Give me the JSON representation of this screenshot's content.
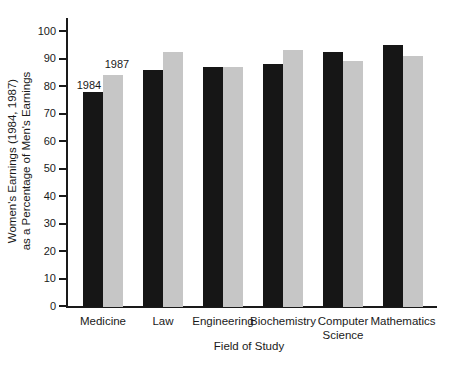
{
  "figure": {
    "y_axis_title_line1": "Women's Earnings (1984, 1987)",
    "y_axis_title_line2": "as a Percentage of Men's Earnings",
    "x_axis_title": "Field of Study"
  },
  "chart_data": {
    "type": "bar",
    "title": "",
    "xlabel": "Field of Study",
    "ylabel": "Women's Earnings (1984, 1987) as a Percentage of Men's Earnings",
    "categories": [
      "Medicine",
      "Law",
      "Engineering",
      "Biochemistry",
      "Computer Science",
      "Mathematics"
    ],
    "series": [
      {
        "name": "1984",
        "color": "#161616",
        "values": [
          78,
          86,
          87,
          88,
          92.5,
          95
        ]
      },
      {
        "name": "1987",
        "color": "#c6c6c6",
        "values": [
          84,
          92.5,
          87,
          93,
          89,
          91
        ]
      }
    ],
    "ylim": [
      0,
      100
    ],
    "ytick_step": 10,
    "grid": false,
    "legend_position": "inline annotations above first category group",
    "annotations": [
      {
        "text": "1984",
        "target": "Medicine 1984 bar"
      },
      {
        "text": "1987",
        "target": "Medicine 1987 bar"
      }
    ]
  }
}
